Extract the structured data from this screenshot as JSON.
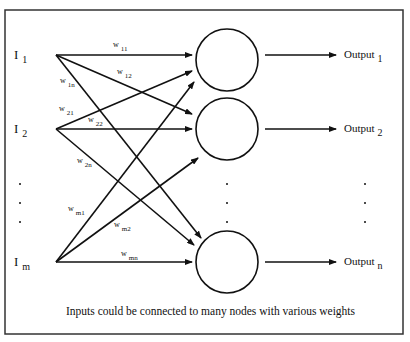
{
  "diagram": {
    "caption": "Inputs could be connected to many nodes with various weights",
    "colors": {
      "line": "#111111",
      "background": "#ffffff",
      "frame": "#333333"
    },
    "inputs": [
      {
        "id": "I1",
        "label": "I",
        "sub": "1",
        "x": 56,
        "y": 55
      },
      {
        "id": "I2",
        "label": "I",
        "sub": "2",
        "x": 56,
        "y": 129
      },
      {
        "id": "Im",
        "label": "I",
        "sub": "m",
        "x": 56,
        "y": 262
      }
    ],
    "nodes": [
      {
        "id": "N1",
        "cx": 227,
        "cy": 60,
        "r": 31
      },
      {
        "id": "N2",
        "cx": 227,
        "cy": 129,
        "r": 31
      },
      {
        "id": "Nn",
        "cx": 227,
        "cy": 262,
        "r": 31
      }
    ],
    "outputs": [
      {
        "id": "O1",
        "label": "Output",
        "sub": "1",
        "y": 55
      },
      {
        "id": "O2",
        "label": "Output",
        "sub": "2",
        "y": 129
      },
      {
        "id": "On",
        "label": "Output",
        "sub": "n",
        "y": 262
      }
    ],
    "weights": [
      {
        "label": "w",
        "sub": "11",
        "from": "I1",
        "to": "N1",
        "x2": 192,
        "y2": 55,
        "lx": 113,
        "ly": 47
      },
      {
        "label": "w",
        "sub": "12",
        "from": "I1",
        "to": "N2",
        "x2": 192,
        "y2": 114,
        "lx": 117,
        "ly": 74
      },
      {
        "label": "w",
        "sub": "1n",
        "from": "I1",
        "to": "Nn",
        "x2": 201,
        "y2": 238,
        "lx": 60,
        "ly": 83
      },
      {
        "label": "w",
        "sub": "21",
        "from": "I2",
        "to": "N1",
        "x2": 192,
        "y2": 71,
        "lx": 59,
        "ly": 111
      },
      {
        "label": "w",
        "sub": "22",
        "from": "I2",
        "to": "N2",
        "x2": 192,
        "y2": 129,
        "lx": 88,
        "ly": 122
      },
      {
        "label": "w",
        "sub": "2n",
        "from": "I2",
        "to": "Nn",
        "x2": 194,
        "y2": 245,
        "lx": 77,
        "ly": 163
      },
      {
        "label": "w",
        "sub": "m1",
        "from": "Im",
        "to": "N1",
        "x2": 194,
        "y2": 82,
        "lx": 68,
        "ly": 211
      },
      {
        "label": "w",
        "sub": "m2",
        "from": "Im",
        "to": "N2",
        "x2": 198,
        "y2": 158,
        "lx": 114,
        "ly": 227
      },
      {
        "label": "w",
        "sub": "mn",
        "from": "Im",
        "to": "Nn",
        "x2": 192,
        "y2": 262,
        "lx": 121,
        "ly": 256
      }
    ],
    "ellipsis": {
      "symbol": ".",
      "input_column": {
        "x": 20,
        "ys": [
          184,
          203,
          222
        ]
      },
      "node_column": {
        "x": 227,
        "ys": [
          184,
          203,
          222
        ]
      },
      "output_column": {
        "x": 365,
        "ys": [
          184,
          203,
          222
        ]
      }
    }
  }
}
